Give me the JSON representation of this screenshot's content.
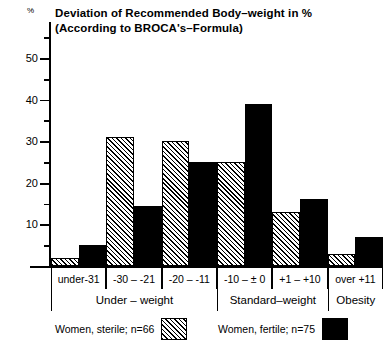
{
  "chart_data": {
    "type": "bar",
    "subtitle": "(According to BROCA's-Formula)",
    "title_lines": [
      "Deviation of Recommended Body–weight in %",
      "(According to BROCA's–Formula)"
    ],
    "xlabel": "",
    "ylabel": "%",
    "y_unit": "%",
    "ylim": [
      0,
      55
    ],
    "grid": false,
    "legend_position": "bottom",
    "y_ticks_major": [
      10,
      20,
      30,
      40,
      50
    ],
    "y_ticks_minor": [
      5,
      15,
      25,
      35,
      45,
      55
    ],
    "y_tick_labels": [
      "10",
      "20",
      "30",
      "40",
      "50"
    ],
    "categories": [
      "under-31",
      "-30 – -21",
      "-20 – -11",
      "-10 – ± 0",
      "+1  –  +10",
      "over +11"
    ],
    "groups": [
      {
        "label": "Under – weight",
        "categories": [
          "under-31",
          "-30 – -21",
          "-20 – -11"
        ]
      },
      {
        "label": "Standard–weight",
        "categories": [
          "-10 – ± 0",
          "+1  –  +10"
        ]
      },
      {
        "label": "Obesity",
        "categories": [
          "over +11"
        ]
      }
    ],
    "series": [
      {
        "name": "Women, sterile; n=66",
        "pattern": "hatched",
        "color": "#000000",
        "values": [
          2,
          31,
          30,
          25,
          13,
          3
        ]
      },
      {
        "name": "Women, fertile; n=75",
        "pattern": "solid",
        "color": "#000000",
        "values": [
          5,
          14.5,
          25,
          39,
          16,
          7
        ]
      }
    ]
  },
  "legend": {
    "entries": [
      {
        "label": "Women, sterile; n=66",
        "pattern": "hatched"
      },
      {
        "label": "Women, fertile; n=75",
        "pattern": "solid"
      }
    ]
  },
  "colors": {
    "foreground": "#000000",
    "background": "#ffffff"
  }
}
